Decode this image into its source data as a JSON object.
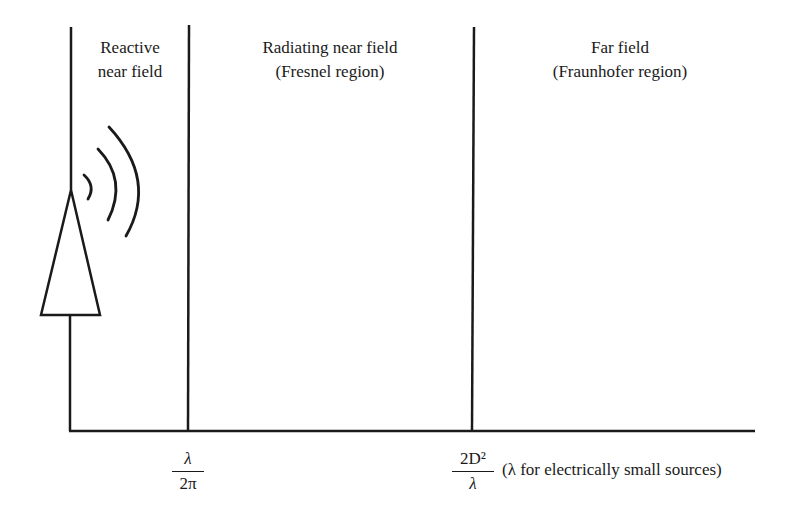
{
  "regions": [
    {
      "line1": "Reactive",
      "line2": "near field"
    },
    {
      "line1": "Radiating near field",
      "line2": "(Fresnel region)"
    },
    {
      "line1": "Far field",
      "line2": "(Fraunhofer region)"
    }
  ],
  "boundaries": [
    {
      "numerator": "λ",
      "denominator": "2π"
    },
    {
      "numerator": "2D²",
      "denominator": "λ",
      "note": "(λ for electrically small sources)"
    }
  ],
  "colors": {
    "stroke": "#1a1a1a",
    "background": "#ffffff"
  }
}
